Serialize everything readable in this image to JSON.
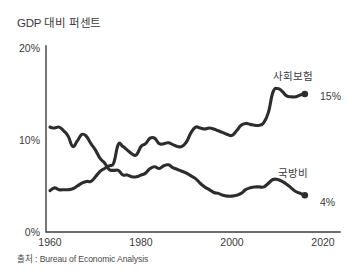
{
  "chart_data": {
    "type": "line",
    "title": "GDP 대비 퍼센트",
    "source": "출처 : Bureau of Economic Analysis",
    "xlabel": "",
    "ylabel": "",
    "xlim": [
      1960,
      2020
    ],
    "ylim": [
      0,
      20
    ],
    "grid": false,
    "legend_position": "inline-right",
    "y_ticks": [
      "0%",
      "10%",
      "20%"
    ],
    "y_tick_values": [
      0,
      10,
      20
    ],
    "x_ticks": [
      "1960",
      "1980",
      "2000",
      "2020"
    ],
    "x_tick_values": [
      1960,
      1980,
      2000,
      2020
    ],
    "series": [
      {
        "name": "사회보험",
        "end_label": "15%",
        "end_value": 15,
        "x": [
          1960,
          1961,
          1962,
          1963,
          1964,
          1965,
          1966,
          1967,
          1968,
          1969,
          1970,
          1971,
          1972,
          1973,
          1974,
          1975,
          1976,
          1977,
          1978,
          1979,
          1980,
          1981,
          1982,
          1983,
          1984,
          1985,
          1986,
          1987,
          1988,
          1989,
          1990,
          1991,
          1992,
          1993,
          1994,
          1995,
          1996,
          1997,
          1998,
          1999,
          2000,
          2001,
          2002,
          2003,
          2004,
          2005,
          2006,
          2007,
          2008,
          2009,
          2010,
          2011,
          2012,
          2013,
          2014,
          2015,
          2016
        ],
        "values": [
          4.5,
          4.8,
          4.6,
          4.6,
          4.6,
          4.7,
          5.0,
          5.3,
          5.5,
          5.5,
          6.0,
          6.6,
          6.9,
          7.2,
          7.5,
          9.5,
          9.3,
          8.9,
          8.5,
          8.4,
          9.3,
          9.6,
          10.2,
          10.2,
          9.6,
          9.6,
          9.7,
          9.5,
          9.3,
          9.3,
          9.8,
          10.8,
          11.4,
          11.3,
          11.2,
          11.3,
          11.2,
          11.0,
          10.8,
          10.6,
          10.5,
          11.0,
          11.6,
          11.8,
          11.7,
          11.6,
          11.6,
          11.9,
          13.0,
          15.2,
          15.6,
          15.3,
          14.8,
          14.7,
          14.7,
          14.9,
          15.0
        ]
      },
      {
        "name": "국방비",
        "end_label": "4%",
        "end_value": 4,
        "x": [
          1960,
          1961,
          1962,
          1963,
          1964,
          1965,
          1966,
          1967,
          1968,
          1969,
          1970,
          1971,
          1972,
          1973,
          1974,
          1975,
          1976,
          1977,
          1978,
          1979,
          1980,
          1981,
          1982,
          1983,
          1984,
          1985,
          1986,
          1987,
          1988,
          1989,
          1990,
          1991,
          1992,
          1993,
          1994,
          1995,
          1996,
          1997,
          1998,
          1999,
          2000,
          2001,
          2002,
          2003,
          2004,
          2005,
          2006,
          2007,
          2008,
          2009,
          2010,
          2011,
          2012,
          2013,
          2014,
          2015,
          2016
        ],
        "values": [
          11.4,
          11.3,
          11.4,
          11.0,
          10.4,
          9.3,
          9.9,
          10.6,
          10.4,
          9.6,
          8.9,
          8.0,
          7.5,
          6.8,
          6.7,
          6.7,
          6.2,
          6.2,
          6.0,
          6.0,
          6.2,
          6.4,
          6.9,
          7.1,
          6.9,
          7.2,
          7.3,
          7.0,
          6.8,
          6.6,
          6.4,
          6.1,
          5.8,
          5.3,
          4.9,
          4.6,
          4.3,
          4.2,
          4.0,
          3.9,
          3.9,
          4.0,
          4.2,
          4.6,
          4.8,
          4.9,
          4.9,
          4.9,
          5.3,
          5.7,
          5.7,
          5.5,
          5.2,
          4.8,
          4.4,
          4.2,
          4.0
        ]
      }
    ]
  },
  "chart": {
    "title": "GDP 대비 퍼센트",
    "source": "출처 : Bureau of Economic Analysis"
  }
}
